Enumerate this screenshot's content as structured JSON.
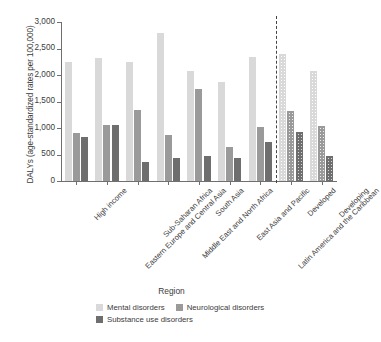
{
  "chart_data": {
    "type": "bar",
    "title": "",
    "xlabel": "Region",
    "ylabel": "DALYs (age-standardized rates per 100,000)",
    "ylim": [
      0,
      3000
    ],
    "yticks": [
      0,
      500,
      1000,
      1500,
      2000,
      2500,
      3000
    ],
    "ytick_labels": [
      "0",
      "500",
      "1,000",
      "1,500",
      "2,000",
      "2,500",
      "3,000"
    ],
    "grid": false,
    "legend_position": "bottom",
    "categories": [
      "High income",
      "Eastern Europe and Central Asia",
      "Sub-Saharan Africa",
      "Middle East and North Africa",
      "South Asia",
      "East Asia and Pacific",
      "Latin America and the Caribbean",
      "Developed",
      "Developing"
    ],
    "series": [
      {
        "name": "Mental disorders",
        "color": "#d9d9d9",
        "values": [
          2250,
          2330,
          2255,
          2790,
          2075,
          1860,
          2340,
          2400,
          2070
        ]
      },
      {
        "name": "Neurological disorders",
        "color": "#9a9a9a",
        "values": [
          905,
          1050,
          1335,
          860,
          1730,
          635,
          1010,
          1320,
          1030
        ]
      },
      {
        "name": "Substance use disorders",
        "color": "#6e6e6e",
        "values": [
          825,
          1050,
          360,
          430,
          470,
          430,
          740,
          920,
          480
        ]
      }
    ],
    "annotations": [
      {
        "type": "vertical-dashed-divider",
        "after_category": "Latin America and the Caribbean",
        "note": "separates world-region groups from Developed/Developing aggregates"
      }
    ],
    "patterned_categories": [
      "Developed",
      "Developing"
    ]
  }
}
